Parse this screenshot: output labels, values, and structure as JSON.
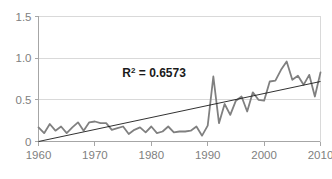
{
  "chart_data": {
    "type": "line",
    "title": "",
    "subtitle": "",
    "xlabel": "",
    "ylabel": "",
    "xlim": [
      1960,
      2010
    ],
    "ylim": [
      0,
      1.5
    ],
    "grid": true,
    "legend": false,
    "legend_position": "none",
    "x_ticks": [
      1960,
      1970,
      1980,
      1990,
      2000,
      2010
    ],
    "x_tick_labels": [
      "1960",
      "1970",
      "1980",
      "1990",
      "2000",
      "2010"
    ],
    "y_ticks": [
      0,
      0.5,
      1.0,
      1.5
    ],
    "y_tick_labels": [
      "0",
      "0.5",
      "1.0",
      "1.5"
    ],
    "annotations": [
      {
        "name": "r-squared",
        "text": "R2 = 0.6573",
        "text_base": "R",
        "text_sup": "2",
        "text_rest": " = 0.6573",
        "x": 1980.5,
        "y": 0.77,
        "bold": true,
        "color": "#1a1a1a"
      }
    ],
    "series": [
      {
        "name": "data",
        "type": "line",
        "color": "#808080",
        "width": 1.8,
        "x": [
          1960,
          1961,
          1962,
          1963,
          1964,
          1965,
          1966,
          1967,
          1968,
          1969,
          1970,
          1971,
          1972,
          1973,
          1974,
          1975,
          1976,
          1977,
          1978,
          1979,
          1980,
          1981,
          1982,
          1983,
          1984,
          1985,
          1986,
          1987,
          1988,
          1989,
          1990,
          1991,
          1992,
          1993,
          1994,
          1995,
          1996,
          1997,
          1998,
          1999,
          2000,
          2001,
          2002,
          2003,
          2004,
          2005,
          2006,
          2007,
          2008,
          2009,
          2010
        ],
        "values": [
          0.17,
          0.1,
          0.21,
          0.13,
          0.18,
          0.1,
          0.17,
          0.23,
          0.13,
          0.23,
          0.24,
          0.22,
          0.22,
          0.14,
          0.16,
          0.18,
          0.09,
          0.14,
          0.17,
          0.11,
          0.18,
          0.1,
          0.12,
          0.18,
          0.11,
          0.12,
          0.12,
          0.13,
          0.18,
          0.07,
          0.19,
          0.78,
          0.22,
          0.45,
          0.32,
          0.49,
          0.54,
          0.36,
          0.59,
          0.5,
          0.49,
          0.72,
          0.73,
          0.86,
          0.96,
          0.74,
          0.79,
          0.68,
          0.8,
          0.54,
          0.83
        ]
      },
      {
        "name": "linear-trendline",
        "type": "line",
        "color": "#1a1a1a",
        "width": 0.9,
        "x": [
          1960,
          2010
        ],
        "values": [
          0.0,
          0.72
        ]
      }
    ],
    "colors": {
      "series_line": "#808080",
      "trendline": "#1a1a1a",
      "gridline": "#d9d9d9",
      "axis": "#a6a6a6",
      "tick_text": "#808080",
      "background": "#ffffff"
    }
  }
}
